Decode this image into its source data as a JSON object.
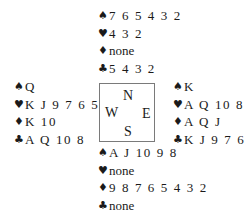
{
  "diagram": {
    "type": "bridge-deal",
    "suit_symbols": {
      "spades": "♠",
      "hearts": "♥",
      "diamonds": "♦",
      "clubs": "♣"
    },
    "compass": {
      "north": "N",
      "south": "S",
      "east": "E",
      "west": "W"
    },
    "hands": {
      "north": {
        "spades": "7 6 5 4 3 2",
        "hearts": "4 3 2",
        "diamonds": "none",
        "clubs": "5 4 3 2"
      },
      "west": {
        "spades": "Q",
        "hearts": "K J 9 7 6 5",
        "diamonds": "K 10",
        "clubs": "A Q 10 8"
      },
      "east": {
        "spades": "K",
        "hearts": "A Q 10 8",
        "diamonds": "A Q J",
        "clubs": "K J 9 7 6"
      },
      "south": {
        "spades": "A J 10 9 8",
        "hearts": "none",
        "diamonds": "9 8 7 6 5 4 3 2",
        "clubs": "none"
      }
    }
  }
}
